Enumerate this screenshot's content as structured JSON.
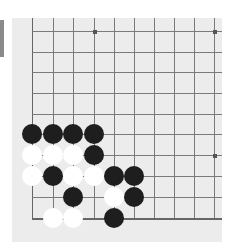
{
  "board": {
    "region": "bottom-left corner",
    "background_color": "#ececec",
    "line_color": "#7a7a7a",
    "columns_x": [
      32,
      53,
      73,
      94,
      114,
      134,
      154,
      174,
      194,
      214
    ],
    "rows_y": [
      31,
      52,
      72,
      93,
      114,
      134,
      155,
      176,
      197,
      218
    ],
    "left_edge_col": 0,
    "bottom_edge_row": 9,
    "star_points": [
      {
        "col": 3,
        "row": 0
      },
      {
        "col": 9,
        "row": 0
      },
      {
        "col": 9,
        "row": 6
      }
    ],
    "stones": [
      {
        "color": "black",
        "col": 0,
        "row": 5
      },
      {
        "color": "black",
        "col": 1,
        "row": 5
      },
      {
        "color": "black",
        "col": 2,
        "row": 5
      },
      {
        "color": "black",
        "col": 3,
        "row": 5
      },
      {
        "color": "white",
        "col": 0,
        "row": 6
      },
      {
        "color": "white",
        "col": 1,
        "row": 6
      },
      {
        "color": "white",
        "col": 2,
        "row": 6
      },
      {
        "color": "black",
        "col": 3,
        "row": 6
      },
      {
        "color": "white",
        "col": 0,
        "row": 7
      },
      {
        "color": "black",
        "col": 1,
        "row": 7
      },
      {
        "color": "white",
        "col": 2,
        "row": 7
      },
      {
        "color": "white",
        "col": 3,
        "row": 7
      },
      {
        "color": "black",
        "col": 4,
        "row": 7
      },
      {
        "color": "black",
        "col": 5,
        "row": 7
      },
      {
        "color": "black",
        "col": 2,
        "row": 8
      },
      {
        "color": "white",
        "col": 4,
        "row": 8
      },
      {
        "color": "black",
        "col": 5,
        "row": 8
      },
      {
        "color": "white",
        "col": 1,
        "row": 9
      },
      {
        "color": "white",
        "col": 2,
        "row": 9
      },
      {
        "color": "black",
        "col": 4,
        "row": 9
      }
    ],
    "colors": {
      "black_stone": "#1e1e1e",
      "white_stone": "#ffffff"
    }
  }
}
